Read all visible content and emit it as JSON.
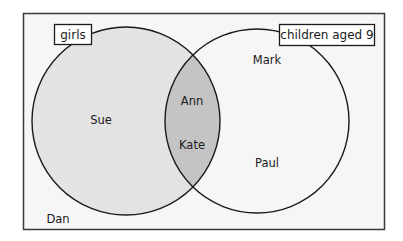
{
  "diagram": {
    "type": "venn",
    "colors": {
      "universe_background": "#f6f6f6",
      "universe_border": "#3a3a3a",
      "set_a_fill": "#e3e3e3",
      "intersection_fill": "#c4c4c4",
      "set_b_fill": "#f6f6f6",
      "circle_stroke": "#1a1a1a"
    },
    "sets": [
      {
        "id": "girls",
        "label": "girls",
        "members_only": [
          "Sue"
        ]
      },
      {
        "id": "children_aged_9",
        "label": "children aged 9",
        "members_only": [
          "Mark",
          "Paul"
        ]
      }
    ],
    "intersection": {
      "sets": [
        "girls",
        "children_aged_9"
      ],
      "members": [
        "Ann",
        "Kate"
      ]
    },
    "outside": {
      "members": [
        "Dan"
      ]
    }
  },
  "labels": {
    "set_a": "girls",
    "set_b": "children aged 9",
    "sue": "Sue",
    "ann": "Ann",
    "kate": "Kate",
    "mark": "Mark",
    "paul": "Paul",
    "dan": "Dan"
  }
}
